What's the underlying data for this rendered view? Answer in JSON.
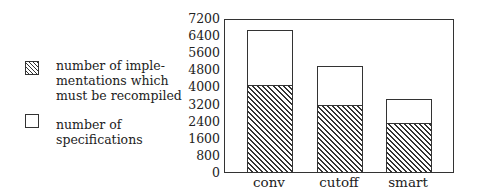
{
  "chart_data": {
    "type": "bar",
    "stacked": false,
    "overlay": true,
    "title": "",
    "xlabel": "",
    "ylabel": "",
    "categories": [
      "conv",
      "cutoff",
      "smart"
    ],
    "series": [
      {
        "name": "number of specifications",
        "pattern": "empty",
        "values": [
          6620,
          4950,
          3400
        ]
      },
      {
        "name": "number of implementations which must be recompiled",
        "pattern": "hatched",
        "values": [
          4050,
          3130,
          2300
        ]
      }
    ],
    "ylim": [
      0,
      7200
    ],
    "yticks": [
      0,
      800,
      1600,
      2400,
      3200,
      4000,
      4800,
      5600,
      6400,
      7200
    ],
    "grid": false,
    "legend_position": "left"
  },
  "legend": {
    "items": [
      {
        "pattern": "hatched",
        "lines": [
          "number of imple-",
          "mentations which",
          "must be recompiled"
        ]
      },
      {
        "pattern": "empty",
        "lines": [
          "number of",
          "specifications"
        ]
      }
    ]
  },
  "axis": {
    "ytick_labels": [
      "7200",
      "6400",
      "5600",
      "4800",
      "4000",
      "3200",
      "2400",
      "1600",
      "800",
      "0"
    ]
  }
}
